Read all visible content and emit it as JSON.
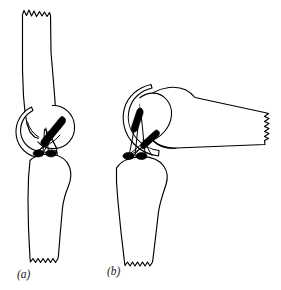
{
  "figure": {
    "background_color": "#ffffff",
    "line_color": "#000000",
    "anchor_color": "#000000",
    "width": 281,
    "height": 290,
    "panels": [
      {
        "id": "a",
        "caption": "(a)",
        "caption_x": 17,
        "caption_y": 278,
        "description": "Knee in extension with femur above and tibia below",
        "joint_position": "extended",
        "anchor_count": 3,
        "suture_count": 6
      },
      {
        "id": "b",
        "caption": "(b)",
        "caption_x": 107,
        "caption_y": 275,
        "description": "Knee in flexion with femur angled to the right",
        "joint_position": "flexed",
        "anchor_count": 4,
        "suture_count": 7
      }
    ],
    "elements": {
      "femur_label": "femur",
      "tibia_label": "tibia",
      "patella_label": "patella",
      "tendon_label": "patellar-tendon",
      "anchor_label": "suture-anchor",
      "suture_label": "crossing-suture",
      "fracture_label": "jagged-bone-cut"
    }
  }
}
